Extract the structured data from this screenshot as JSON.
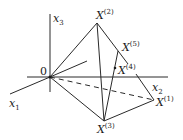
{
  "diagram": {
    "axes": {
      "x1": {
        "label": "x",
        "sub": "1"
      },
      "x2": {
        "label": "x",
        "sub": "2"
      },
      "x3": {
        "label": "x",
        "sub": "3"
      },
      "origin": "0"
    },
    "points": [
      {
        "id": "X1",
        "base": "X",
        "sup": "(1)"
      },
      {
        "id": "X2",
        "base": "X",
        "sup": "(2)"
      },
      {
        "id": "X3",
        "base": "X",
        "sup": "(3)"
      },
      {
        "id": "X4",
        "base": "X",
        "sup": "(4)"
      },
      {
        "id": "X5",
        "base": "X",
        "sup": "(5)"
      }
    ],
    "colors": {
      "stroke": "#2a2a2a",
      "background": "#ffffff"
    }
  }
}
